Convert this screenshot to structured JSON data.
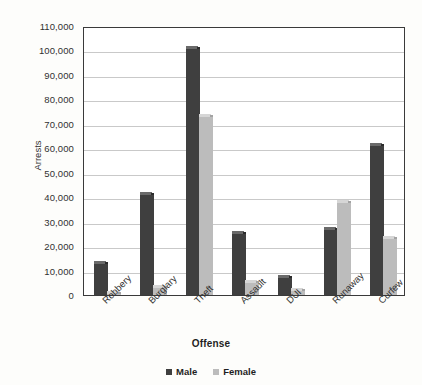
{
  "chart_data": {
    "type": "bar",
    "title": "",
    "xlabel": "Offense",
    "ylabel": "Arrests",
    "categories": [
      "Robbery",
      "Burglary",
      "Theft",
      "Assault",
      "DUI",
      "Runaway",
      "Curfew"
    ],
    "series": [
      {
        "name": "Male",
        "color": "#3f3f3f",
        "values": [
          14000,
          42000,
          102000,
          26000,
          8000,
          28000,
          62000
        ]
      },
      {
        "name": "Female",
        "color": "#bcbcbc",
        "values": [
          1800,
          4000,
          74000,
          6000,
          3000,
          39000,
          24000
        ]
      }
    ],
    "ylim": [
      0,
      110000
    ],
    "ytick_step": 10000,
    "ytick_labels": [
      "110,000",
      "100,000",
      "90,000",
      "80,000",
      "70,000",
      "60,000",
      "50,000",
      "40,000",
      "30,000",
      "20,000",
      "10,000",
      "0"
    ],
    "grid": true,
    "legend_position": "bottom"
  },
  "legend": {
    "items": [
      {
        "label": "Male"
      },
      {
        "label": "Female"
      }
    ]
  }
}
